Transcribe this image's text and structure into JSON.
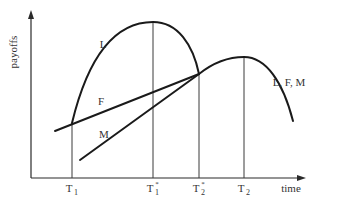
{
  "diagram": {
    "y_axis_label": "payoffs",
    "x_axis_label": "time",
    "ticks": [
      {
        "id": "T1",
        "base": "T",
        "sub": "1",
        "star": false,
        "x": 72
      },
      {
        "id": "T1*",
        "base": "T",
        "sub": "1",
        "star": true,
        "x": 153
      },
      {
        "id": "T2*",
        "base": "T",
        "sub": "2",
        "star": true,
        "x": 199
      },
      {
        "id": "T2",
        "base": "T",
        "sub": "2",
        "star": false,
        "x": 244
      }
    ],
    "curve_labels": {
      "leader": "L",
      "follower": "F",
      "matching": "M",
      "combined": "L, F, M"
    },
    "colors": {
      "ink": "#1a1a1a",
      "background": "#ffffff"
    }
  }
}
